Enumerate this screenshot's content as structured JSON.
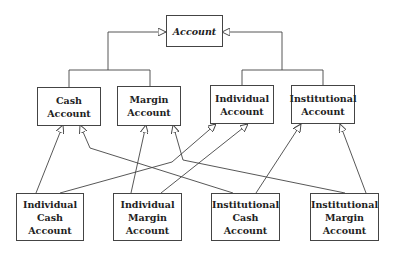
{
  "diagram": {
    "type": "uml-class-inheritance",
    "stroke_color": "#444444",
    "background": "#ffffff",
    "nodes": {
      "account": {
        "lines": [
          "Account"
        ],
        "italic": true
      },
      "cash_account": {
        "lines": [
          "Cash",
          "Account"
        ]
      },
      "margin_account": {
        "lines": [
          "Margin",
          "Account"
        ]
      },
      "individual_account": {
        "lines": [
          "Individual",
          "Account"
        ]
      },
      "institutional_account": {
        "lines": [
          "Institutional",
          "Account"
        ]
      },
      "individual_cash_account": {
        "lines": [
          "Individual",
          "Cash",
          "Account"
        ]
      },
      "individual_margin_account": {
        "lines": [
          "Individual",
          "Margin",
          "Account"
        ]
      },
      "institutional_cash_account": {
        "lines": [
          "Institutional",
          "Cash",
          "Account"
        ]
      },
      "institutional_margin_account": {
        "lines": [
          "Institutional",
          "Margin",
          "Account"
        ]
      }
    },
    "edges": [
      {
        "from": "Cash Account",
        "to": "Account",
        "kind": "generalization"
      },
      {
        "from": "Margin Account",
        "to": "Account",
        "kind": "generalization"
      },
      {
        "from": "Individual Account",
        "to": "Account",
        "kind": "generalization"
      },
      {
        "from": "Institutional Account",
        "to": "Account",
        "kind": "generalization"
      },
      {
        "from": "Individual Cash Account",
        "to": "Cash Account",
        "kind": "generalization"
      },
      {
        "from": "Individual Cash Account",
        "to": "Individual Account",
        "kind": "generalization"
      },
      {
        "from": "Individual Margin Account",
        "to": "Margin Account",
        "kind": "generalization"
      },
      {
        "from": "Individual Margin Account",
        "to": "Individual Account",
        "kind": "generalization"
      },
      {
        "from": "Institutional Cash Account",
        "to": "Cash Account",
        "kind": "generalization"
      },
      {
        "from": "Institutional Cash Account",
        "to": "Institutional Account",
        "kind": "generalization"
      },
      {
        "from": "Institutional Margin Account",
        "to": "Margin Account",
        "kind": "generalization"
      },
      {
        "from": "Institutional Margin Account",
        "to": "Institutional Account",
        "kind": "generalization"
      }
    ]
  }
}
